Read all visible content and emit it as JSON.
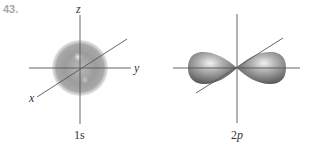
{
  "problem": {
    "number": "43."
  },
  "diagrams": [
    {
      "caption": "1s",
      "shape": "sphere",
      "axes": {
        "x": "x",
        "y": "y",
        "z": "z"
      },
      "color": "#8c8c8c"
    },
    {
      "caption_prefix": "2",
      "caption_suffix": "p",
      "shape": "dumbbell",
      "color": "#7a7a7a"
    }
  ]
}
